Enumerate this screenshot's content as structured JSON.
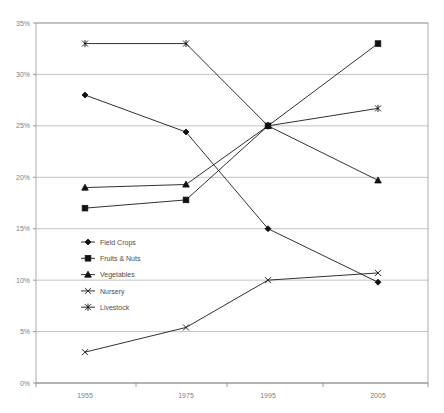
{
  "chart_data": {
    "type": "line",
    "title": "",
    "subtitle": "",
    "xlabel": "",
    "ylabel": "",
    "categories": [
      "1955",
      "1975",
      "1995",
      "2005"
    ],
    "x": [
      1955,
      1975,
      1995,
      2005
    ],
    "ylim": [
      0,
      35
    ],
    "ytick_values": [
      0,
      5,
      10,
      15,
      20,
      25,
      30,
      35
    ],
    "ytick_labels": [
      "0%",
      "5%",
      "10%",
      "15%",
      "20%",
      "25%",
      "30%",
      "35%"
    ],
    "grid": true,
    "legend_position": "inside-lower-left",
    "series": [
      {
        "name": "Field Crops",
        "marker": "diamond",
        "values": [
          28.0,
          24.4,
          15.0,
          9.8
        ]
      },
      {
        "name": "Fruits & Nuts",
        "marker": "square",
        "values": [
          17.0,
          17.8,
          25.0,
          33.0
        ]
      },
      {
        "name": "Vegetables",
        "marker": "triangle",
        "values": [
          19.0,
          19.3,
          25.0,
          19.7
        ]
      },
      {
        "name": "Nursery",
        "marker": "cross-x",
        "values": [
          3.0,
          5.4,
          10.0,
          10.7
        ]
      },
      {
        "name": "Livestock",
        "marker": "asterisk",
        "values": [
          33.0,
          33.0,
          25.0,
          26.7
        ]
      }
    ]
  },
  "axes": {
    "x_tick_labels": [
      "1955",
      "1975",
      "1995",
      "2005"
    ],
    "y_tick_labels": [
      "35%",
      "30%",
      "25%",
      "20%",
      "15%",
      "10%",
      "5%",
      "0%"
    ]
  },
  "legend": {
    "items": [
      {
        "label": "Field Crops",
        "marker": "diamond"
      },
      {
        "label": "Fruits & Nuts",
        "marker": "square"
      },
      {
        "label": "Vegetables",
        "marker": "triangle"
      },
      {
        "label": "Nursery",
        "marker": "cross-x"
      },
      {
        "label": "Livestock",
        "marker": "asterisk"
      }
    ]
  },
  "colors": {
    "series_ink": "#111111",
    "gridline": "#a9a9a9",
    "frame": "#9a9a9a",
    "tick_text": "#808080",
    "legend_text": "#4d4d4d",
    "background": "#ffffff"
  }
}
